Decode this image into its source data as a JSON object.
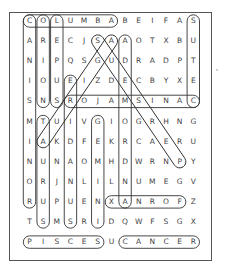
{
  "puzzle": {
    "rows": [
      "COLUMBABEIFAS",
      "ARECJSAAOTXBU",
      "NIPQSGUDRADPT",
      "IOUEIZDECBYXE",
      "SNSROJAMSINAC",
      "MTUIVGIOGRHNG",
      "IAKDFEKRCAERU",
      "NUNAOMHDWRNPY",
      "ORJNLILNUMEGV",
      "RUPUENXANROFZ",
      "TSMSRIDQWFSGX",
      "PISCESUCANCER"
    ],
    "found_words": [
      {
        "word": "COLUMBA",
        "r1": 0,
        "c1": 0,
        "r2": 0,
        "c2": 6
      },
      {
        "word": "CANIS MAJOR",
        "r1": 4,
        "c1": 12,
        "r2": 4,
        "c2": 3
      },
      {
        "word": "FORNAX",
        "r1": 9,
        "c1": 11,
        "r2": 9,
        "c2": 6
      },
      {
        "word": "PISCES",
        "r1": 11,
        "c1": 0,
        "r2": 11,
        "c2": 5
      },
      {
        "word": "CANCER",
        "r1": 11,
        "c1": 7,
        "r2": 11,
        "c2": 12
      },
      {
        "word": "CANIS MINOR",
        "r1": 0,
        "c1": 0,
        "r2": 9,
        "c2": 0
      },
      {
        "word": "ORION",
        "r1": 0,
        "c1": 1,
        "r2": 4,
        "c2": 1
      },
      {
        "word": "LEPUS",
        "r1": 0,
        "c1": 2,
        "r2": 4,
        "c2": 2
      },
      {
        "word": "CETUS",
        "r1": 4,
        "c1": 12,
        "r2": 0,
        "c2": 12
      },
      {
        "word": "TAURUS",
        "r1": 5,
        "c1": 1,
        "r2": 10,
        "c2": 1
      },
      {
        "word": "ERIDANUS",
        "r1": 3,
        "c1": 3,
        "r2": 10,
        "c2": 3
      },
      {
        "word": "GEMINI",
        "r1": 5,
        "c1": 5,
        "r2": 10,
        "c2": 5
      },
      {
        "word": "ANDROMEDA",
        "r1": 9,
        "c1": 7,
        "r2": 1,
        "c2": 7
      },
      {
        "word": "AURIGA",
        "r1": 6,
        "c1": 1,
        "r2": 1,
        "c2": 6
      },
      {
        "word": "PERSEUS",
        "r1": 7,
        "c1": 11,
        "r2": 1,
        "c2": 5
      }
    ]
  }
}
